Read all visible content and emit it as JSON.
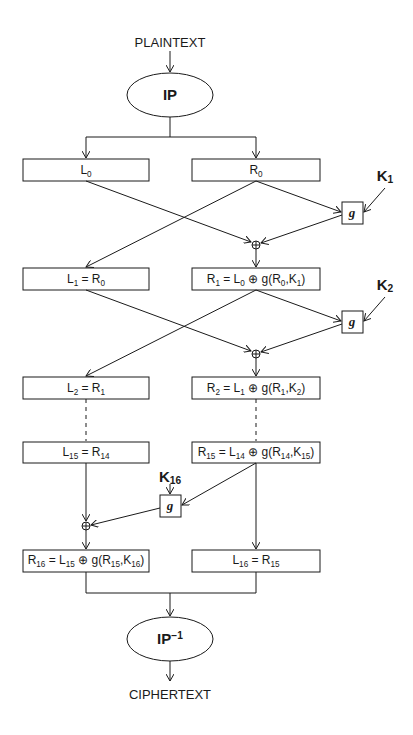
{
  "input_label": "PLAINTEXT",
  "output_label": "CIPHERTEXT",
  "initial_permutation": {
    "text": "IP"
  },
  "final_permutation": {
    "text": "IP",
    "superscript": "−1"
  },
  "function_label": "g",
  "xor_symbol": "⊕",
  "rounds": [
    {
      "left": {
        "base": "L",
        "sub": "0",
        "rest": ""
      },
      "right": {
        "base": "R",
        "sub": "0",
        "rest": ""
      }
    },
    {
      "left_text": "L₁ = R₀",
      "right_text": "R₁ = L₀ ⊕ g(R₀,K₁)"
    },
    {
      "left_text": "L₂ = R₁",
      "right_text": "R₂ = L₁ ⊕ g(R₁,K₂)"
    },
    {
      "left_text": "L₁₅ = R₁₄",
      "right_text": "R₁₅ = L₁₄ ⊕ g(R₁₄,K₁₅)"
    },
    {
      "left_text": "R₁₆ = L₁₅ ⊕ g(R₁₅,K₁₆)",
      "right_text": "L₁₆ = R₁₅"
    }
  ],
  "keys": [
    {
      "base": "K",
      "sub": "1"
    },
    {
      "base": "K",
      "sub": "2"
    },
    {
      "base": "K",
      "sub": "16"
    }
  ],
  "boxes": {
    "l0": "L",
    "l0_sub": "0",
    "r0": "R",
    "r0_sub": "0",
    "l1": [
      "L",
      "1",
      " = R",
      "0"
    ],
    "r1": [
      "R",
      "1",
      " = L",
      "0",
      " ⊕ g(R",
      "0",
      ",K",
      "1",
      ")"
    ],
    "l2": [
      "L",
      "2",
      " = R",
      "1"
    ],
    "r2": [
      "R",
      "2",
      " = L",
      "1",
      " ⊕ g(R",
      "1",
      ",K",
      "2",
      ")"
    ],
    "l15": [
      "L",
      "15",
      " = R",
      "14"
    ],
    "r15": [
      "R",
      "15",
      " = L",
      "14",
      " ⊕ g(R",
      "14",
      ",K",
      "15",
      ")"
    ],
    "r16": [
      "R",
      "16",
      " = L",
      "15",
      " ⊕ g(R",
      "15",
      ",K",
      "16",
      ")"
    ],
    "l16": [
      "L",
      "16",
      " = R",
      "15"
    ]
  }
}
